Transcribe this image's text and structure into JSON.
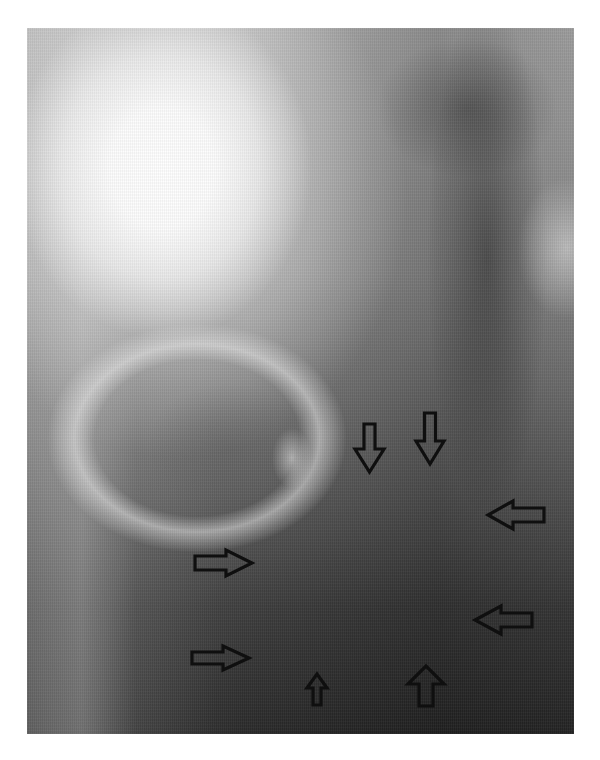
{
  "figure": {
    "type": "radiograph",
    "colors": {
      "background": "#ffffff",
      "arrow_stroke": "#0f0f0f",
      "bone_highlight": "#ffffff",
      "soft_tissue_dark": "#2a2a2a"
    },
    "arrows": [
      {
        "id": "arrow-1",
        "direction": "down",
        "x": 354,
        "y": 423,
        "w": 31,
        "h": 50
      },
      {
        "id": "arrow-2",
        "direction": "down",
        "x": 415,
        "y": 412,
        "w": 30,
        "h": 53
      },
      {
        "id": "arrow-3",
        "direction": "left",
        "x": 487,
        "y": 500,
        "w": 58,
        "h": 30
      },
      {
        "id": "arrow-4",
        "direction": "right",
        "x": 194,
        "y": 549,
        "w": 59,
        "h": 28
      },
      {
        "id": "arrow-5",
        "direction": "left",
        "x": 474,
        "y": 605,
        "w": 59,
        "h": 30
      },
      {
        "id": "arrow-6",
        "direction": "right",
        "x": 191,
        "y": 645,
        "w": 59,
        "h": 26
      },
      {
        "id": "arrow-7",
        "direction": "up",
        "x": 306,
        "y": 673,
        "w": 22,
        "h": 33
      },
      {
        "id": "arrow-8",
        "direction": "up",
        "x": 407,
        "y": 665,
        "w": 38,
        "h": 42
      }
    ]
  }
}
